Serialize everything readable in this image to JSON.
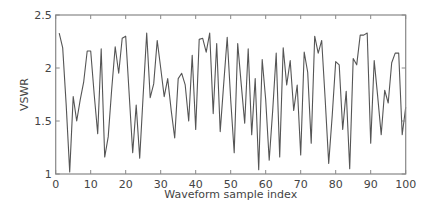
{
  "chart_data": {
    "type": "line",
    "title": "",
    "xlabel": "Waveform sample index",
    "ylabel": "VSWR",
    "xlim": [
      0,
      100
    ],
    "ylim": [
      1,
      2.5
    ],
    "xticks": [
      0,
      10,
      20,
      30,
      40,
      50,
      60,
      70,
      80,
      90,
      100
    ],
    "yticks": [
      1,
      1.5,
      2,
      2.5
    ],
    "ytick_labels": [
      "1",
      "1.5",
      "2",
      "2.5"
    ],
    "grid": false,
    "legend": null,
    "series": [
      {
        "name": "VSWR",
        "color": "#555555",
        "x": [
          1,
          2,
          3,
          4,
          5,
          6,
          7,
          8,
          9,
          10,
          11,
          12,
          13,
          14,
          15,
          16,
          17,
          18,
          19,
          20,
          21,
          22,
          23,
          24,
          25,
          26,
          27,
          28,
          29,
          30,
          31,
          32,
          33,
          34,
          35,
          36,
          37,
          38,
          39,
          40,
          41,
          42,
          43,
          44,
          45,
          46,
          47,
          48,
          49,
          50,
          51,
          52,
          53,
          54,
          55,
          56,
          57,
          58,
          59,
          60,
          61,
          62,
          63,
          64,
          65,
          66,
          67,
          68,
          69,
          70,
          71,
          72,
          73,
          74,
          75,
          76,
          77,
          78,
          79,
          80,
          81,
          82,
          83,
          84,
          85,
          86,
          87,
          88,
          89,
          90,
          91,
          92,
          93,
          94,
          95,
          96,
          97,
          98,
          99,
          100
        ],
        "values": [
          2.33,
          2.19,
          1.65,
          1.02,
          1.73,
          1.5,
          1.7,
          1.87,
          2.16,
          2.16,
          1.75,
          1.38,
          2.18,
          1.16,
          1.35,
          1.8,
          2.2,
          1.95,
          2.28,
          2.3,
          1.75,
          1.2,
          1.65,
          1.15,
          1.75,
          2.33,
          1.72,
          1.85,
          2.26,
          2.0,
          1.73,
          1.9,
          1.6,
          1.34,
          1.9,
          1.95,
          1.84,
          1.5,
          2.12,
          1.42,
          2.27,
          2.28,
          2.15,
          2.33,
          1.57,
          2.23,
          1.4,
          1.85,
          2.29,
          1.7,
          1.2,
          2.23,
          1.85,
          1.48,
          2.18,
          1.37,
          1.9,
          1.04,
          2.08,
          1.7,
          1.13,
          1.6,
          2.14,
          1.16,
          2.19,
          1.84,
          2.07,
          1.6,
          1.84,
          1.18,
          2.15,
          1.96,
          1.29,
          2.3,
          2.14,
          2.26,
          1.7,
          1.1,
          1.55,
          2.06,
          2.03,
          1.42,
          1.78,
          1.05,
          2.09,
          2.03,
          2.31,
          2.31,
          2.33,
          1.29,
          2.07,
          1.73,
          1.37,
          1.79,
          1.67,
          2.05,
          2.14,
          2.14,
          1.37,
          1.63
        ]
      }
    ]
  },
  "colors": {
    "axis": "#888888",
    "line": "#555555",
    "text": "#444444"
  }
}
